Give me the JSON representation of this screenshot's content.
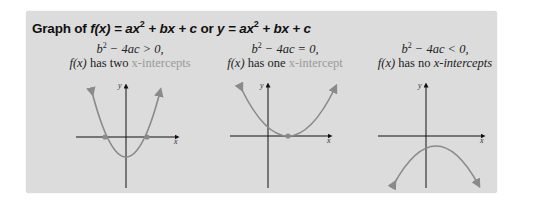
{
  "title": {
    "prefix": "Graph of ",
    "fx": "f(x)",
    "eq1": " = ax",
    "exp": "2",
    "eq1_rest": " + bx + c",
    "or": " or ",
    "y": "y",
    "eq2": " = ax",
    "eq2_rest": " + bx + c"
  },
  "panels": [
    {
      "condition_lhs": "b",
      "condition_exp": "2",
      "condition_rhs": " − 4ac > 0,",
      "desc_fx": "f(x)",
      "desc_text": " has two ",
      "desc_highlight": "x-intercepts",
      "desc_tail": ""
    },
    {
      "condition_lhs": "b",
      "condition_exp": "2",
      "condition_rhs": " − 4ac = 0,",
      "desc_fx": "f(x)",
      "desc_text": " has one ",
      "desc_highlight": "x-intercept",
      "desc_tail": ""
    },
    {
      "condition_lhs": "b",
      "condition_exp": "2",
      "condition_rhs": " − 4ac < 0,",
      "desc_fx": "f(x)",
      "desc_text": " has no ",
      "desc_highlight": "",
      "desc_tail": "x-intercepts"
    }
  ],
  "axis_labels": {
    "x": "x",
    "y": "y"
  },
  "colors": {
    "background": "#dcdcdc",
    "curve": "#8a8a8a",
    "axis": "#111111",
    "highlight_text": "#9a9a9a"
  }
}
